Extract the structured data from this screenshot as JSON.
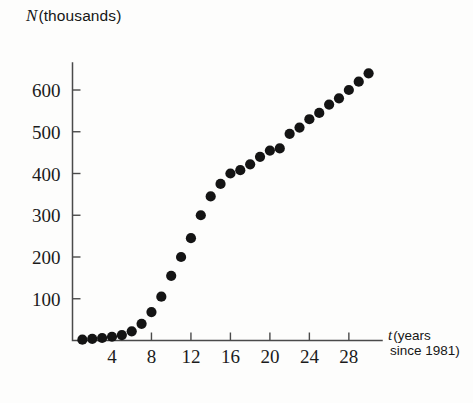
{
  "chart_data": {
    "type": "scatter",
    "title": "",
    "ylabel": "N (thousands)",
    "ylabel_symbol": "N",
    "ylabel_rest": "(thousands)",
    "xlabel": "t (years since 1981)",
    "xlabel_symbol": "t",
    "xlabel_rest_line1": "(years",
    "xlabel_rest_line2": "since 1981)",
    "xlim": [
      0,
      31
    ],
    "ylim": [
      0,
      680
    ],
    "xticks": [
      4,
      8,
      12,
      16,
      20,
      24,
      28
    ],
    "yticks": [
      100,
      200,
      300,
      400,
      500,
      600
    ],
    "grid": false,
    "legend": null,
    "marker": "filled-circle",
    "marker_color": "#141414",
    "axis_color": "#4a4a4a",
    "x": [
      1,
      2,
      3,
      4,
      5,
      6,
      7,
      8,
      9,
      10,
      11,
      12,
      13,
      14,
      15,
      16,
      17,
      18,
      19,
      20,
      21,
      22,
      23,
      24,
      25,
      26,
      27,
      28,
      29,
      30
    ],
    "values": [
      2,
      4,
      6,
      9,
      13,
      22,
      40,
      68,
      105,
      155,
      200,
      245,
      300,
      345,
      375,
      400,
      408,
      422,
      440,
      455,
      460,
      495,
      510,
      530,
      545,
      565,
      580,
      600,
      620,
      640
    ],
    "series": [
      {
        "name": "N",
        "values": [
          2,
          4,
          6,
          9,
          13,
          22,
          40,
          68,
          105,
          155,
          200,
          245,
          300,
          345,
          375,
          400,
          408,
          422,
          440,
          455,
          460,
          495,
          510,
          530,
          545,
          565,
          580,
          600,
          620,
          640
        ]
      }
    ]
  }
}
